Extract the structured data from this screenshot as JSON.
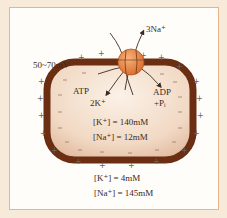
{
  "diagram": {
    "membrane_potential": "50~70mV",
    "pump_out": "3Na⁺",
    "pump_in": "2K⁺",
    "atp": "ATP",
    "adp": "ADP",
    "pi": "+Pᵢ",
    "inside": {
      "k": "[K⁺] = 140mM",
      "na": "[Na⁺] = 12mM"
    },
    "outside": {
      "k": "[K⁺] = 4mM",
      "na": "[Na⁺] = 145mM"
    },
    "colors": {
      "membrane": "#6b2e12",
      "pump": "#e8894a",
      "frame_border": "#e8b48c",
      "background": "#f8ead8"
    }
  }
}
